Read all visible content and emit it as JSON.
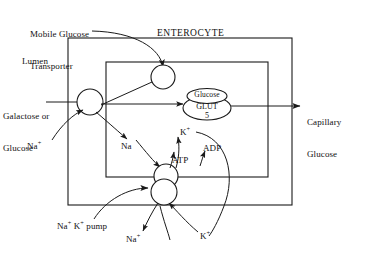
{
  "figure": {
    "title_region": "Intestinal glucose absorption across the enterocyte",
    "compartments": {
      "lumen": "Lumen",
      "enterocyte": "ENTEROCYTE",
      "capillary": "Capillary\nGlucose"
    },
    "labels": {
      "mobile_transporter": "Mobile Glucose\nTransporter",
      "substrate": "Galactose or\nGlucose",
      "glut_top": "Glucose",
      "glut_mid": "GLUT",
      "glut_bottom": "5",
      "sodium_lumen": "Na",
      "sodium_lumen_sup": "+",
      "sodium_cell": "Na",
      "potassium_in": "K",
      "potassium_in_sup": "+",
      "atp": "ATP",
      "adp": "ADP",
      "pump": "Na⁺ K⁺ pump",
      "pump_na": "Na",
      "pump_na_sup": "+",
      "pump_k": "K",
      "pump_k_sup": "+",
      "sodium_out": "Na",
      "sodium_out_sup": "+",
      "potassium_out": "K",
      "potassium_out_sup": "+",
      "capillary_line1": "Capillary",
      "capillary_line2": "Glucose",
      "mobile_line1": "Mobile Glucose",
      "mobile_line2": "Transporter",
      "substrate_line1": "Galactose or",
      "substrate_line2": "Glucose",
      "pump_line_prefix": "Na",
      "pump_line_mid": " K",
      "pump_line_suffix": " pump"
    },
    "colors": {
      "stroke": "#1a1a1a",
      "background": "#ffffff",
      "text": "#111111"
    },
    "nodes": [
      {
        "name": "apical-sglt-transporter",
        "shape": "circle",
        "cx": 90,
        "cy": 102,
        "r": 13
      },
      {
        "name": "mobile-glucose-transporter-vesicle",
        "shape": "circle",
        "cx": 163,
        "cy": 77,
        "r": 12
      },
      {
        "name": "glut5-glucose-top",
        "shape": "ellipse",
        "cx": 207,
        "cy": 97,
        "rx": 20,
        "ry": 8
      },
      {
        "name": "glut5-carrier",
        "shape": "ellipse",
        "cx": 207,
        "cy": 108,
        "rx": 24,
        "ry": 12
      },
      {
        "name": "pump-upper-subunit",
        "shape": "circle",
        "cx": 166,
        "cy": 176,
        "r": 12
      },
      {
        "name": "pump-lower-subunit",
        "shape": "circle",
        "cx": 164,
        "cy": 192,
        "r": 13
      }
    ],
    "boxes": [
      {
        "name": "enterocyte-outer-box",
        "x": 68,
        "y": 38,
        "w": 224,
        "h": 167
      },
      {
        "name": "enterocyte-inner-box",
        "x": 106,
        "y": 62,
        "w": 162,
        "h": 115
      }
    ]
  }
}
